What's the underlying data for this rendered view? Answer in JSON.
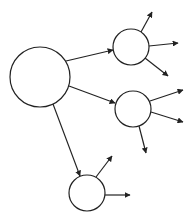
{
  "diagram": {
    "type": "tree-graph",
    "stroke_color": "#222222",
    "background": "#ffffff",
    "nodes": [
      {
        "id": "root",
        "cx": 40,
        "cy": 77,
        "r": 30
      },
      {
        "id": "child-1",
        "cx": 131,
        "cy": 47,
        "r": 18
      },
      {
        "id": "child-2",
        "cx": 133,
        "cy": 109,
        "r": 18
      },
      {
        "id": "child-3",
        "cx": 87,
        "cy": 193,
        "r": 18
      }
    ],
    "edges": [
      {
        "from": "root",
        "x1": 66,
        "y1": 61,
        "x2": 113,
        "y2": 50
      },
      {
        "from": "root",
        "x1": 69,
        "y1": 86,
        "x2": 115,
        "y2": 103
      },
      {
        "from": "root",
        "x1": 53,
        "y1": 104,
        "x2": 80,
        "y2": 176
      },
      {
        "from": "child-1",
        "x1": 141,
        "y1": 32,
        "x2": 152,
        "y2": 12
      },
      {
        "from": "child-1",
        "x1": 149,
        "y1": 46,
        "x2": 178,
        "y2": 43
      },
      {
        "from": "child-1",
        "x1": 145,
        "y1": 58,
        "x2": 168,
        "y2": 76
      },
      {
        "from": "child-2",
        "x1": 150,
        "y1": 101,
        "x2": 183,
        "y2": 90
      },
      {
        "from": "child-2",
        "x1": 151,
        "y1": 112,
        "x2": 183,
        "y2": 122
      },
      {
        "from": "child-2",
        "x1": 139,
        "y1": 126,
        "x2": 146,
        "y2": 153
      },
      {
        "from": "child-3",
        "x1": 96,
        "y1": 177,
        "x2": 112,
        "y2": 156
      },
      {
        "from": "child-3",
        "x1": 105,
        "y1": 195,
        "x2": 130,
        "y2": 195
      }
    ]
  }
}
